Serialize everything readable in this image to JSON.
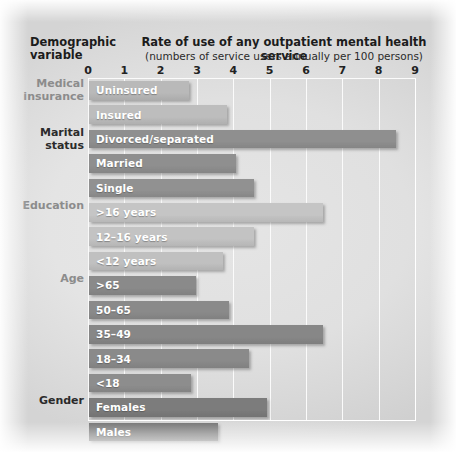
{
  "header": {
    "left_label": "Demographic variable",
    "title": "Rate of use of any outpatient mental health service",
    "subtitle": "(numbers of service users annually per 100 persons)"
  },
  "axis": {
    "ticks": [
      "0",
      "1",
      "2",
      "3",
      "4",
      "5",
      "6",
      "7",
      "8",
      "9"
    ]
  },
  "groups": [
    {
      "label": "Medical insurance",
      "color": "#b9b9b9"
    },
    {
      "label": "Marital status",
      "color": "#8f8f8f"
    },
    {
      "label": "Education",
      "color": "#c5c5c5"
    },
    {
      "label": "Age",
      "color": "#8a8a8a"
    },
    {
      "label": "Gender",
      "color": "#7c7c7c"
    }
  ],
  "chart_data": {
    "type": "bar",
    "orientation": "horizontal",
    "title": "Rate of use of any outpatient mental health service",
    "subtitle": "(numbers of service users annually per 100 persons)",
    "xlabel": "numbers of service users annually per 100 persons",
    "ylabel": "Demographic variable",
    "xlim": [
      0,
      9
    ],
    "xticks": [
      0,
      1,
      2,
      3,
      4,
      5,
      6,
      7,
      8,
      9
    ],
    "grid": true,
    "legend": "none",
    "categories": [
      "Uninsured",
      "Insured",
      "Divorced/separated",
      "Married",
      "Single",
      ">16 years",
      "12–16 years",
      "<12 years",
      ">65",
      "50–65",
      "35–49",
      "18–34",
      "<18",
      "Females",
      "Males"
    ],
    "values": [
      2.75,
      3.8,
      8.45,
      4.05,
      4.55,
      6.45,
      4.55,
      3.7,
      2.95,
      3.85,
      6.45,
      4.4,
      2.8,
      4.9,
      3.55
    ],
    "bars": [
      {
        "label": "Uninsured",
        "value": 2.75,
        "group": "Medical insurance",
        "color": "#b9b9b9"
      },
      {
        "label": "Insured",
        "value": 3.8,
        "group": "Medical insurance",
        "color": "#bdbdbd"
      },
      {
        "label": "Divorced/separated",
        "value": 8.45,
        "group": "Marital status",
        "color": "#8f8f8f"
      },
      {
        "label": "Married",
        "value": 4.05,
        "group": "Marital status",
        "color": "#8f8f8f"
      },
      {
        "label": "Single",
        "value": 4.55,
        "group": "Marital status",
        "color": "#919191"
      },
      {
        "label": ">16 years",
        "value": 6.45,
        "group": "Education",
        "color": "#c5c5c5"
      },
      {
        "label": "12–16 years",
        "value": 4.55,
        "group": "Education",
        "color": "#c3c3c3"
      },
      {
        "label": "<12 years",
        "value": 3.7,
        "group": "Education",
        "color": "#c0c0c0"
      },
      {
        "label": ">65",
        "value": 2.95,
        "group": "Age",
        "color": "#8a8a8a"
      },
      {
        "label": "50–65",
        "value": 3.85,
        "group": "Age",
        "color": "#8a8a8a"
      },
      {
        "label": "35–49",
        "value": 6.45,
        "group": "Age",
        "color": "#878787"
      },
      {
        "label": "18–34",
        "value": 4.4,
        "group": "Age",
        "color": "#8a8a8a"
      },
      {
        "label": "<18",
        "value": 2.8,
        "group": "Age",
        "color": "#8d8d8d"
      },
      {
        "label": "Females",
        "value": 4.9,
        "group": "Gender",
        "color": "#7c7c7c"
      },
      {
        "label": "Males",
        "value": 3.55,
        "group": "Gender",
        "color": "#767676"
      }
    ]
  }
}
